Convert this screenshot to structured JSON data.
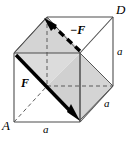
{
  "figure": {
    "type": "cube-force-couple-diagram",
    "background_color": "#ffffff",
    "line_color": "#4d4d4d",
    "heavy_line_color": "#000000",
    "shade_color": "#d9d9d9",
    "shade_color_dark": "#cccccc",
    "labels": {
      "vertex_a": "A",
      "vertex_d": "D",
      "edge_bottom": "a",
      "edge_right_vertical": "a",
      "edge_depth": "a",
      "force_positive": "F",
      "force_negative": "−F"
    },
    "vectors": [
      {
        "name": "F",
        "label": "F",
        "style": "solid",
        "color": "#000000",
        "from": [
          16,
          55
        ],
        "to": [
          78,
          120
        ]
      },
      {
        "name": "-F",
        "label": "−F",
        "style": "dashed",
        "color": "#000000",
        "from": [
          80,
          50
        ],
        "to": [
          45,
          18
        ]
      }
    ],
    "vertices": {
      "front_bottom_left": [
        14,
        122
      ],
      "front_top_left": [
        14,
        53
      ],
      "front_top_right": [
        80,
        53
      ],
      "front_bottom_right": [
        80,
        122
      ],
      "back_bottom_left": [
        47,
        86
      ],
      "back_top_left": [
        47,
        17
      ],
      "back_top_right": [
        113,
        17
      ],
      "back_bottom_right": [
        113,
        86
      ]
    }
  }
}
